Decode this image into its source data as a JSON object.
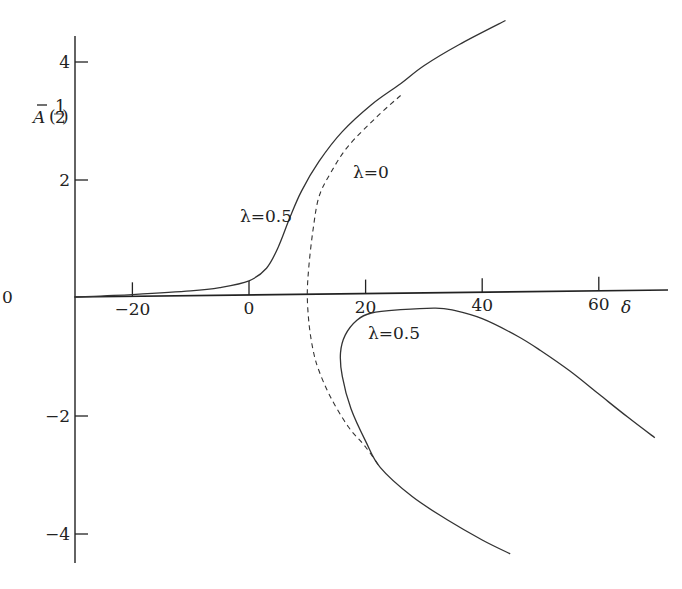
{
  "chart_data": {
    "type": "line",
    "title": "",
    "xlabel": "δ",
    "ylabel": "Ā(½)",
    "xlim": [
      -30,
      70
    ],
    "ylim": [
      -4.6,
      4.6
    ],
    "grid": false,
    "legend": null,
    "x_ticks": [
      -20,
      0,
      20,
      40,
      60
    ],
    "x_tick_labels": [
      "−20",
      "0",
      "20",
      "40",
      "60"
    ],
    "y_ticks": [
      4,
      2,
      0,
      -2,
      -4
    ],
    "y_tick_labels": [
      "4",
      "2",
      "0",
      "−2",
      "−4"
    ],
    "series": [
      {
        "name": "λ=0.5 (upper branch)",
        "style": "solid",
        "points": [
          [
            -30,
            0.0
          ],
          [
            -20,
            0.03
          ],
          [
            -10,
            0.08
          ],
          [
            -5,
            0.13
          ],
          [
            0,
            0.24
          ],
          [
            3,
            0.45
          ],
          [
            5,
            0.8
          ],
          [
            7,
            1.3
          ],
          [
            9,
            1.75
          ],
          [
            12,
            2.25
          ],
          [
            16,
            2.75
          ],
          [
            21,
            3.2
          ],
          [
            26,
            3.55
          ],
          [
            30,
            3.85
          ],
          [
            36,
            4.2
          ],
          [
            44,
            4.6
          ]
        ]
      },
      {
        "name": "λ=0",
        "style": "dashed",
        "points": [
          [
            26,
            3.35
          ],
          [
            22,
            3.0
          ],
          [
            17,
            2.5
          ],
          [
            14,
            2.05
          ],
          [
            12,
            1.65
          ],
          [
            11,
            1.1
          ],
          [
            10.3,
            0.5
          ],
          [
            10,
            0.0
          ],
          [
            10.3,
            -0.5
          ],
          [
            11,
            -0.95
          ],
          [
            12,
            -1.3
          ],
          [
            14,
            -1.75
          ],
          [
            17,
            -2.25
          ],
          [
            20,
            -2.6
          ],
          [
            22.5,
            -2.95
          ]
        ]
      },
      {
        "name": "λ=0.5 (lower branch)",
        "style": "solid",
        "points": [
          [
            69.6,
            -2.5
          ],
          [
            65,
            -2.15
          ],
          [
            60,
            -1.75
          ],
          [
            55,
            -1.35
          ],
          [
            50,
            -1.0
          ],
          [
            46,
            -0.75
          ],
          [
            40,
            -0.45
          ],
          [
            35,
            -0.3
          ],
          [
            32,
            -0.26
          ],
          [
            26,
            -0.28
          ],
          [
            21,
            -0.33
          ],
          [
            18.5,
            -0.45
          ],
          [
            16.5,
            -0.7
          ],
          [
            15.7,
            -1.0
          ],
          [
            16,
            -1.4
          ],
          [
            17.5,
            -1.95
          ],
          [
            20,
            -2.5
          ],
          [
            22.5,
            -2.95
          ],
          [
            28,
            -3.45
          ],
          [
            34,
            -3.85
          ],
          [
            40,
            -4.2
          ],
          [
            44.8,
            -4.44
          ]
        ]
      }
    ],
    "annotations": [
      {
        "text": "λ=0.5",
        "x": 7.5,
        "y": 1.5,
        "target": "upper branch"
      },
      {
        "text": "λ=0",
        "x": 18,
        "y": 2.1,
        "target": "dashed curve"
      },
      {
        "text": "λ=0.5",
        "x": 22.5,
        "y": -0.6,
        "target": "lower branch"
      }
    ]
  },
  "labels": {
    "y_axis_A": "A",
    "y_axis_half_num": "1",
    "y_axis_half_den": "2",
    "x_axis": "δ",
    "ann_upper": "λ=0.5",
    "ann_dashed": "λ=0",
    "ann_lower": "λ=0.5",
    "origin_y": "0"
  }
}
